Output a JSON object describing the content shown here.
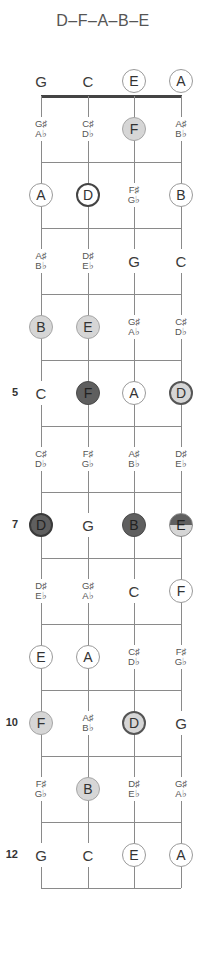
{
  "title": "D–F–A–B–E",
  "strings": [
    "G",
    "C",
    "E",
    "A"
  ],
  "fret_markers": [
    {
      "fret": 5,
      "label": "5"
    },
    {
      "fret": 7,
      "label": "7"
    },
    {
      "fret": 10,
      "label": "10"
    },
    {
      "fret": 12,
      "label": "12"
    }
  ],
  "rows": [
    {
      "fret": 0,
      "cells": [
        {
          "type": "plain",
          "note": "G"
        },
        {
          "type": "plain",
          "note": "C"
        },
        {
          "type": "open",
          "note": "E"
        },
        {
          "type": "open",
          "note": "A"
        }
      ]
    },
    {
      "fret": 1,
      "cells": [
        {
          "type": "acc",
          "sharp": "G♯",
          "flat": "A♭"
        },
        {
          "type": "acc",
          "sharp": "C♯",
          "flat": "D♭"
        },
        {
          "type": "light",
          "note": "F"
        },
        {
          "type": "acc",
          "sharp": "A♯",
          "flat": "B♭"
        }
      ]
    },
    {
      "fret": 2,
      "cells": [
        {
          "type": "open",
          "note": "A"
        },
        {
          "type": "root-open",
          "note": "D"
        },
        {
          "type": "acc",
          "sharp": "F♯",
          "flat": "G♭"
        },
        {
          "type": "open",
          "note": "B"
        }
      ]
    },
    {
      "fret": 3,
      "cells": [
        {
          "type": "acc",
          "sharp": "A♯",
          "flat": "B♭"
        },
        {
          "type": "acc",
          "sharp": "D♯",
          "flat": "E♭"
        },
        {
          "type": "plain",
          "note": "G"
        },
        {
          "type": "plain",
          "note": "C"
        }
      ]
    },
    {
      "fret": 4,
      "cells": [
        {
          "type": "light",
          "note": "B"
        },
        {
          "type": "light",
          "note": "E"
        },
        {
          "type": "acc",
          "sharp": "G♯",
          "flat": "A♭"
        },
        {
          "type": "acc",
          "sharp": "C♯",
          "flat": "D♭"
        }
      ]
    },
    {
      "fret": 5,
      "cells": [
        {
          "type": "plain",
          "note": "C"
        },
        {
          "type": "dark",
          "note": "F"
        },
        {
          "type": "open",
          "note": "A"
        },
        {
          "type": "root-light",
          "note": "D"
        }
      ]
    },
    {
      "fret": 6,
      "cells": [
        {
          "type": "acc",
          "sharp": "C♯",
          "flat": "D♭"
        },
        {
          "type": "acc",
          "sharp": "F♯",
          "flat": "G♭"
        },
        {
          "type": "acc",
          "sharp": "A♯",
          "flat": "B♭"
        },
        {
          "type": "acc",
          "sharp": "D♯",
          "flat": "E♭"
        }
      ]
    },
    {
      "fret": 7,
      "cells": [
        {
          "type": "root-dark",
          "note": "D"
        },
        {
          "type": "plain",
          "note": "G"
        },
        {
          "type": "dark",
          "note": "B"
        },
        {
          "type": "split",
          "note": "E"
        }
      ]
    },
    {
      "fret": 8,
      "cells": [
        {
          "type": "acc",
          "sharp": "D♯",
          "flat": "E♭"
        },
        {
          "type": "acc",
          "sharp": "G♯",
          "flat": "A♭"
        },
        {
          "type": "plain",
          "note": "C"
        },
        {
          "type": "open",
          "note": "F"
        }
      ]
    },
    {
      "fret": 9,
      "cells": [
        {
          "type": "open",
          "note": "E"
        },
        {
          "type": "open",
          "note": "A"
        },
        {
          "type": "acc",
          "sharp": "C♯",
          "flat": "D♭"
        },
        {
          "type": "acc",
          "sharp": "F♯",
          "flat": "G♭"
        }
      ]
    },
    {
      "fret": 10,
      "cells": [
        {
          "type": "light",
          "note": "F"
        },
        {
          "type": "acc",
          "sharp": "A♯",
          "flat": "B♭"
        },
        {
          "type": "root-light",
          "note": "D"
        },
        {
          "type": "plain",
          "note": "G"
        }
      ]
    },
    {
      "fret": 11,
      "cells": [
        {
          "type": "acc",
          "sharp": "F♯",
          "flat": "G♭"
        },
        {
          "type": "light",
          "note": "B"
        },
        {
          "type": "acc",
          "sharp": "D♯",
          "flat": "E♭"
        },
        {
          "type": "acc",
          "sharp": "G♯",
          "flat": "A♭"
        }
      ]
    },
    {
      "fret": 12,
      "cells": [
        {
          "type": "plain",
          "note": "G"
        },
        {
          "type": "plain",
          "note": "C"
        },
        {
          "type": "open",
          "note": "E"
        },
        {
          "type": "open",
          "note": "A"
        }
      ]
    }
  ],
  "colors": {
    "light_fill": "#d6d6d6",
    "dark_fill": "#5f5f5f",
    "line": "#8a8a8a",
    "nut": "#444444"
  }
}
